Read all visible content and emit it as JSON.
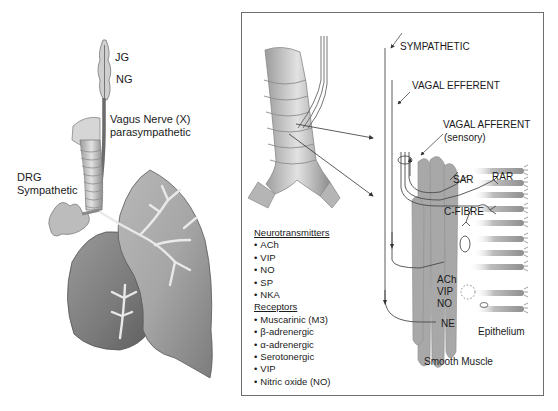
{
  "left_figure": {
    "labels": {
      "jg": "JG",
      "ng": "NG",
      "vagus_line1": "Vagus Nerve (X)",
      "vagus_line2": "parasympathetic",
      "drg_line1": "DRG",
      "drg_line2": "Sympathetic"
    }
  },
  "right_panel": {
    "pathways": {
      "sympathetic": "SYMPATHETIC",
      "vagal_efferent": "VAGAL EFFERENT",
      "vagal_afferent": "VAGAL AFFERENT",
      "vagal_afferent_sub": "(sensory)"
    },
    "receptor_labels": {
      "sar": "SAR",
      "rar": "RAR",
      "c_fibre": "C-FIBRE"
    },
    "transmitter_labels": [
      "ACh",
      "VIP",
      "NO"
    ],
    "ne_label": "NE",
    "tissue_labels": {
      "epithelium": "Epithelium",
      "smooth_muscle": "Smooth Muscle"
    },
    "legend": {
      "neurotransmitters_header": "Neurotransmitters",
      "neurotransmitters": [
        "ACh",
        "VIP",
        "NO",
        "SP",
        "NKA"
      ],
      "receptors_header": "Receptors",
      "receptors": [
        "Muscarinic (M3)",
        "β-adrenergic",
        "α-adrenergic",
        "Serotonergic",
        "VIP",
        "Nitric oxide (NO)"
      ]
    }
  },
  "colors": {
    "line": "#4a4a4a",
    "tissue_dark": "#8a8a8a",
    "tissue_mid": "#b5b5b5",
    "tissue_light": "#d9d9d9",
    "border": "#6d6d6d"
  }
}
